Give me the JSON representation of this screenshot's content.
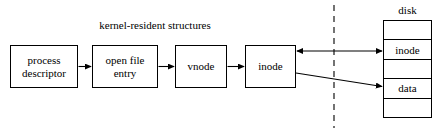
{
  "diagram": {
    "title": "kernel-resident structures",
    "background_color": "#ffffff",
    "stroke_color": "#000000",
    "width": 443,
    "height": 131
  },
  "kernel_chain": {
    "nodes": [
      {
        "id": "process-descriptor",
        "label": "process\ndescriptor"
      },
      {
        "id": "open-file-entry",
        "label": "open file\nentry"
      },
      {
        "id": "vnode",
        "label": "vnode"
      },
      {
        "id": "inode",
        "label": "inode"
      }
    ]
  },
  "disk": {
    "label": "disk",
    "rows": [
      {
        "label": ""
      },
      {
        "label": "inode"
      },
      {
        "label": ""
      },
      {
        "label": "data"
      },
      {
        "label": ""
      }
    ]
  },
  "connectors": [
    {
      "name": "process-to-openfile",
      "style": "solid-arrow",
      "direction": "right"
    },
    {
      "name": "openfile-to-vnode",
      "style": "solid-arrow",
      "direction": "right"
    },
    {
      "name": "vnode-to-inode",
      "style": "solid-arrow",
      "direction": "right"
    },
    {
      "name": "inode-to-disk-inode",
      "style": "solid-arrow",
      "direction": "both"
    },
    {
      "name": "inode-to-disk-data",
      "style": "solid-arrow",
      "direction": "right"
    }
  ],
  "boundary": {
    "name": "kernel-disk-boundary",
    "style": "dashed-vertical"
  }
}
